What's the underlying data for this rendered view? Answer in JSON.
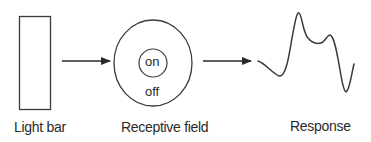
{
  "diagram": {
    "stages": [
      {
        "id": "light-bar",
        "label": "Light bar"
      },
      {
        "id": "receptive-field",
        "label": "Receptive field",
        "center_label": "on",
        "surround_label": "off"
      },
      {
        "id": "response",
        "label": "Response"
      }
    ],
    "arrows": [
      {
        "from": "light-bar",
        "to": "receptive-field"
      },
      {
        "from": "receptive-field",
        "to": "response"
      }
    ],
    "colors": {
      "stroke": "#3a3a3a",
      "text": "#2a2a2a",
      "background": "#ffffff"
    }
  }
}
